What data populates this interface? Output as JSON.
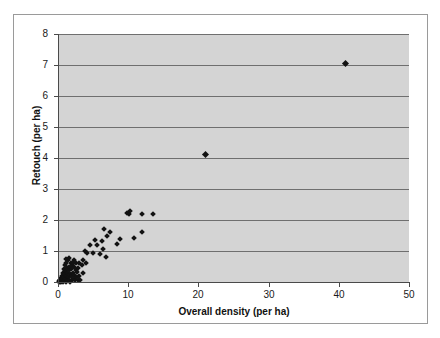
{
  "chart_data": {
    "type": "scatter",
    "title": "",
    "xlabel": "Overall density (per ha)",
    "ylabel": "Retouch (per ha)",
    "xlim": [
      0,
      50
    ],
    "ylim": [
      0,
      8
    ],
    "xticks": [
      0,
      10,
      20,
      30,
      40,
      50
    ],
    "yticks": [
      0,
      1,
      2,
      3,
      4,
      5,
      6,
      7,
      8
    ],
    "grid": "horizontal",
    "legend": "none",
    "marker": "filled-diamond",
    "marker_color": "#121212",
    "plot_background": "#d4d4d4",
    "gridline_color": "#6f6f6f",
    "series": [
      {
        "name": "sites",
        "points": [
          [
            0.15,
            0.0
          ],
          [
            0.2,
            0.02
          ],
          [
            0.25,
            0.05
          ],
          [
            0.3,
            0.0
          ],
          [
            0.35,
            0.08
          ],
          [
            0.4,
            0.12
          ],
          [
            0.45,
            0.0
          ],
          [
            0.5,
            0.05
          ],
          [
            0.55,
            0.2
          ],
          [
            0.6,
            0.1
          ],
          [
            0.65,
            0.3
          ],
          [
            0.7,
            0.0
          ],
          [
            0.75,
            0.15
          ],
          [
            0.8,
            0.42
          ],
          [
            0.85,
            0.25
          ],
          [
            0.9,
            0.05
          ],
          [
            0.95,
            0.55
          ],
          [
            1.0,
            0.1
          ],
          [
            1.05,
            0.35
          ],
          [
            1.1,
            0.0
          ],
          [
            1.15,
            0.62
          ],
          [
            1.2,
            0.2
          ],
          [
            1.25,
            0.45
          ],
          [
            1.3,
            0.08
          ],
          [
            1.35,
            0.3
          ],
          [
            1.4,
            0.72
          ],
          [
            1.45,
            0.15
          ],
          [
            1.5,
            0.5
          ],
          [
            1.55,
            0.05
          ],
          [
            1.6,
            0.38
          ],
          [
            1.65,
            0.25
          ],
          [
            1.7,
            0.0
          ],
          [
            1.8,
            0.6
          ],
          [
            1.85,
            0.18
          ],
          [
            1.9,
            0.42
          ],
          [
            2.0,
            0.05
          ],
          [
            2.05,
            0.55
          ],
          [
            2.1,
            0.3
          ],
          [
            2.15,
            0.1
          ],
          [
            2.25,
            0.48
          ],
          [
            2.3,
            0.22
          ],
          [
            2.4,
            0.05
          ],
          [
            2.5,
            0.4
          ],
          [
            2.55,
            0.62
          ],
          [
            2.6,
            0.15
          ],
          [
            2.7,
            0.32
          ],
          [
            2.8,
            0.08
          ],
          [
            2.9,
            0.45
          ],
          [
            3.0,
            0.2
          ],
          [
            3.1,
            0.05
          ],
          [
            1.1,
            0.75
          ],
          [
            1.6,
            0.78
          ],
          [
            2.2,
            0.62
          ],
          [
            2.35,
            0.72
          ],
          [
            3.0,
            0.62
          ],
          [
            3.4,
            0.55
          ],
          [
            3.5,
            0.3
          ],
          [
            3.6,
            0.72
          ],
          [
            3.8,
            1.0
          ],
          [
            4.0,
            0.62
          ],
          [
            4.2,
            0.95
          ],
          [
            4.6,
            1.2
          ],
          [
            5.0,
            0.92
          ],
          [
            5.2,
            1.35
          ],
          [
            5.6,
            1.18
          ],
          [
            6.0,
            0.9
          ],
          [
            6.2,
            1.32
          ],
          [
            6.4,
            1.05
          ],
          [
            6.6,
            1.7
          ],
          [
            6.8,
            0.82
          ],
          [
            7.0,
            1.5
          ],
          [
            7.4,
            1.62
          ],
          [
            8.4,
            1.22
          ],
          [
            8.8,
            1.38
          ],
          [
            9.8,
            2.22
          ],
          [
            10.1,
            2.18
          ],
          [
            10.3,
            2.3
          ],
          [
            10.8,
            1.42
          ],
          [
            11.9,
            2.2
          ],
          [
            12.0,
            1.6
          ],
          [
            13.5,
            2.2
          ],
          [
            21.0,
            4.1
          ],
          [
            41.0,
            7.05
          ]
        ]
      }
    ]
  },
  "axis": {
    "y_tick_labels": [
      "8",
      "7",
      "6",
      "5",
      "4",
      "3",
      "2",
      "1",
      "0"
    ],
    "x_tick_labels": [
      "0",
      "10",
      "20",
      "30",
      "40",
      "50"
    ]
  }
}
